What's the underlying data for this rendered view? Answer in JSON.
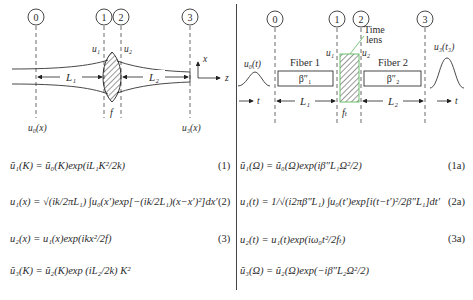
{
  "figure": {
    "left_panel": {
      "title": "Spatial lens imaging",
      "planes": [
        "0",
        "1",
        "2",
        "3"
      ],
      "labels": {
        "u1": "u₁",
        "u2": "u₂",
        "L1": "L₁",
        "L2": "L₂",
        "f": "f",
        "u0x": "u₀(x)",
        "u3x": "u₃(x)",
        "axis_x": "x",
        "axis_z": "z"
      },
      "equations": [
        {
          "text": "ũ₁(K) = ũ₀(K)exp(iL₁K²/2k)",
          "number": "(1)"
        },
        {
          "text": "u₁(x) = √(ik/2πL₁) ∫u₀(x′)exp[−(ik/2L₁)(x−x′)²]dx′",
          "number": "(2)"
        },
        {
          "text": "u₂(x) = u₁(x)exp(ikx²/2f)",
          "number": "(3)"
        },
        {
          "text": "ũ₃(K) = ũ₂(K)exp (iL₂/2k) K²",
          "number": ""
        }
      ]
    },
    "right_panel": {
      "title": "Time lens imaging",
      "planes": [
        "0",
        "1",
        "2",
        "3"
      ],
      "labels": {
        "time_lens": "Time lens",
        "time_lens_line1": "Time",
        "time_lens_line2": "lens",
        "fiber1": "Fiber 1",
        "fiber2": "Fiber 2",
        "beta1": "β″₁",
        "beta2": "β″₂",
        "u0t": "u₀(t)",
        "u3t": "u₃(t₃)",
        "u1": "u₁",
        "u2": "u₂",
        "L1": "L₁",
        "L2": "L₂",
        "ft": "fₜ",
        "t_axis": "t"
      },
      "time_lens_color": "#5cb85c",
      "equations": [
        {
          "text": "ũ₁(Ω) = ũ₀(Ω)exp(iβ″L₁Ω²/2)",
          "number": "(1a)"
        },
        {
          "text": "u₁(t) = 1/√(i2πβ″L₁) ∫u₀(t′)exp[i(t−t′)²/2β″L₁]dt′",
          "number": "(2a)"
        },
        {
          "text": "u₂(t) = u₁(t)exp(iω₀t²/2fₜ)",
          "number": "(3a)"
        },
        {
          "text": "ũ₃(Ω) = ũ₂(Ω)exp(−iβ″L₂Ω²/2)",
          "number": ""
        }
      ]
    }
  }
}
